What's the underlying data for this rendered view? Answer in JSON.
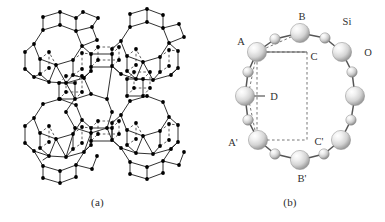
{
  "figure": {
    "type": "scientific-figure",
    "background_color": "#ffffff"
  },
  "panel_a": {
    "caption": "(a)",
    "kind": "framework-lattice-diagram",
    "vertex_color": "#000000",
    "solid_line_color": "#1a1a1a",
    "dashed_line_color": "#3a3a3a",
    "description": "Faujasite-type zeolite framework drawn as dots (T-atoms) joined by solid and dashed bonds, forming sodalite cages, hexagonal prisms and a central twelve-ring supercage window"
  },
  "panel_b": {
    "caption": "(b)",
    "kind": "twelve-membered-ring",
    "ring_members": 12,
    "sphere_fill_light": "#f4f4f4",
    "sphere_fill_mid": "#d2d2d2",
    "sphere_fill_dark": "#9a9a9a",
    "bond_color": "#555555",
    "dashed_color": "#777777",
    "legend": [
      {
        "id": "si",
        "label": "Si",
        "sphere": "large"
      },
      {
        "id": "o",
        "label": "O",
        "sphere": "small"
      }
    ],
    "labels": [
      {
        "id": "A",
        "text": "A",
        "x": 46,
        "y": 45
      },
      {
        "id": "B",
        "text": "B",
        "x": 107,
        "y": 20
      },
      {
        "id": "C",
        "text": "C",
        "x": 117,
        "y": 56
      },
      {
        "id": "D",
        "text": "D",
        "x": 77,
        "y": 99
      },
      {
        "id": "Ap",
        "text": "A'",
        "x": 36,
        "y": 145
      },
      {
        "id": "Bp",
        "text": "B'",
        "x": 109,
        "y": 183
      },
      {
        "id": "Cp",
        "text": "C'",
        "x": 120,
        "y": 147
      },
      {
        "id": "Si",
        "text": "Si",
        "x": 152,
        "y": 23
      },
      {
        "id": "O",
        "text": "O",
        "x": 172,
        "y": 53
      }
    ]
  }
}
